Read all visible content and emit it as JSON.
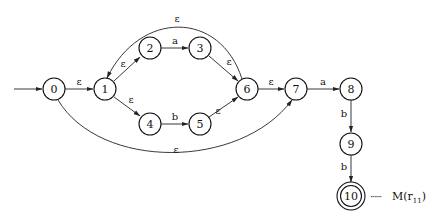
{
  "diagram": {
    "type": "NFA state transition diagram",
    "states": [
      {
        "id": "0",
        "label": "0",
        "start": true,
        "accept": false
      },
      {
        "id": "1",
        "label": "1",
        "start": false,
        "accept": false
      },
      {
        "id": "2",
        "label": "2",
        "start": false,
        "accept": false
      },
      {
        "id": "3",
        "label": "3",
        "start": false,
        "accept": false
      },
      {
        "id": "4",
        "label": "4",
        "start": false,
        "accept": false
      },
      {
        "id": "5",
        "label": "5",
        "start": false,
        "accept": false
      },
      {
        "id": "6",
        "label": "6",
        "start": false,
        "accept": false
      },
      {
        "id": "7",
        "label": "7",
        "start": false,
        "accept": false
      },
      {
        "id": "8",
        "label": "8",
        "start": false,
        "accept": false
      },
      {
        "id": "9",
        "label": "9",
        "start": false,
        "accept": false
      },
      {
        "id": "10",
        "label": "10",
        "start": false,
        "accept": true
      }
    ],
    "transitions": [
      {
        "from": "0",
        "to": "1",
        "label": "ε"
      },
      {
        "from": "1",
        "to": "2",
        "label": "ε"
      },
      {
        "from": "2",
        "to": "3",
        "label": "a"
      },
      {
        "from": "3",
        "to": "6",
        "label": "ε"
      },
      {
        "from": "1",
        "to": "4",
        "label": "ε"
      },
      {
        "from": "4",
        "to": "5",
        "label": "b"
      },
      {
        "from": "5",
        "to": "6",
        "label": "ε"
      },
      {
        "from": "6",
        "to": "1",
        "label": "ε"
      },
      {
        "from": "0",
        "to": "7",
        "label": "ε"
      },
      {
        "from": "6",
        "to": "7",
        "label": "ε"
      },
      {
        "from": "7",
        "to": "8",
        "label": "a"
      },
      {
        "from": "8",
        "to": "9",
        "label": "b"
      },
      {
        "from": "9",
        "to": "10",
        "label": "b"
      }
    ],
    "annotation": {
      "dots": "······",
      "text": "M(r",
      "subscript": "11",
      "close": ")"
    }
  }
}
